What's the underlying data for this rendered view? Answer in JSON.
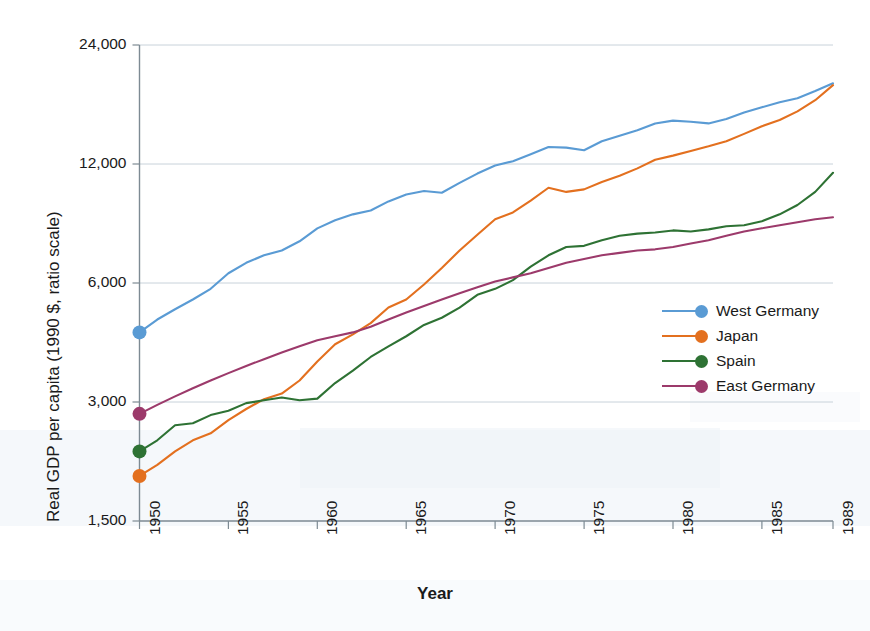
{
  "chart_data": {
    "type": "line",
    "title": "",
    "xlabel": "Year",
    "ylabel": "Real GDP per capita (1990 $, ratio scale)",
    "scale": "log",
    "grid": true,
    "legend_position": "right-middle",
    "xlim": [
      1950,
      1989
    ],
    "ylim": [
      1500,
      24000
    ],
    "ytick_labels": [
      "24,000",
      "12,000",
      "6,000",
      "3,000",
      "1,500"
    ],
    "ytick_values": [
      24000,
      12000,
      6000,
      3000,
      1500
    ],
    "xtick_labels": [
      "1950",
      "1955",
      "1960",
      "1965",
      "1970",
      "1975",
      "1980",
      "1985",
      "1989"
    ],
    "xtick_values": [
      1950,
      1955,
      1960,
      1965,
      1970,
      1975,
      1980,
      1985,
      1989
    ],
    "x": [
      1950,
      1951,
      1952,
      1953,
      1954,
      1955,
      1956,
      1957,
      1958,
      1959,
      1960,
      1961,
      1962,
      1963,
      1964,
      1965,
      1966,
      1967,
      1968,
      1969,
      1970,
      1971,
      1972,
      1973,
      1974,
      1975,
      1976,
      1977,
      1978,
      1979,
      1980,
      1981,
      1982,
      1983,
      1984,
      1985,
      1986,
      1987,
      1988,
      1989
    ],
    "series": [
      {
        "name": "West Germany",
        "color": "#5a9bd4",
        "marker_start": true,
        "values": [
          4500,
          4850,
          5150,
          5450,
          5800,
          6350,
          6750,
          7050,
          7250,
          7650,
          8250,
          8650,
          8950,
          9150,
          9650,
          10050,
          10250,
          10150,
          10750,
          11350,
          11900,
          12200,
          12700,
          13250,
          13200,
          13000,
          13700,
          14150,
          14600,
          15200,
          15450,
          15350,
          15200,
          15600,
          16200,
          16700,
          17200,
          17600,
          18350,
          19200
        ]
      },
      {
        "name": "Japan",
        "color": "#e3701f",
        "marker_start": true,
        "values": [
          1950,
          2080,
          2250,
          2400,
          2500,
          2700,
          2880,
          3050,
          3150,
          3400,
          3800,
          4200,
          4450,
          4750,
          5200,
          5450,
          5950,
          6550,
          7250,
          7950,
          8700,
          9050,
          9700,
          10450,
          10200,
          10350,
          10800,
          11200,
          11700,
          12300,
          12600,
          12950,
          13300,
          13700,
          14300,
          14950,
          15500,
          16300,
          17400,
          19000
        ]
      },
      {
        "name": "Spain",
        "color": "#2e7234",
        "marker_start": true,
        "values": [
          2250,
          2400,
          2620,
          2650,
          2780,
          2850,
          2980,
          3030,
          3080,
          3030,
          3060,
          3350,
          3600,
          3900,
          4150,
          4400,
          4700,
          4900,
          5200,
          5600,
          5800,
          6100,
          6600,
          7050,
          7400,
          7450,
          7700,
          7900,
          8000,
          8050,
          8150,
          8100,
          8200,
          8350,
          8400,
          8600,
          8950,
          9450,
          10200,
          11400
        ]
      },
      {
        "name": "East Germany",
        "color": "#9c3a6b",
        "marker_start": true,
        "values": [
          2800,
          2950,
          3100,
          3250,
          3400,
          3550,
          3700,
          3850,
          4000,
          4150,
          4300,
          4400,
          4500,
          4650,
          4850,
          5050,
          5250,
          5450,
          5650,
          5850,
          6050,
          6200,
          6350,
          6550,
          6750,
          6900,
          7050,
          7150,
          7250,
          7300,
          7400,
          7550,
          7700,
          7900,
          8100,
          8250,
          8400,
          8550,
          8700,
          8800
        ]
      }
    ]
  },
  "legend": {
    "items": [
      {
        "label": "West Germany",
        "color": "#5a9bd4"
      },
      {
        "label": "Japan",
        "color": "#e3701f"
      },
      {
        "label": "Spain",
        "color": "#2e7234"
      },
      {
        "label": "East Germany",
        "color": "#9c3a6b"
      }
    ]
  }
}
